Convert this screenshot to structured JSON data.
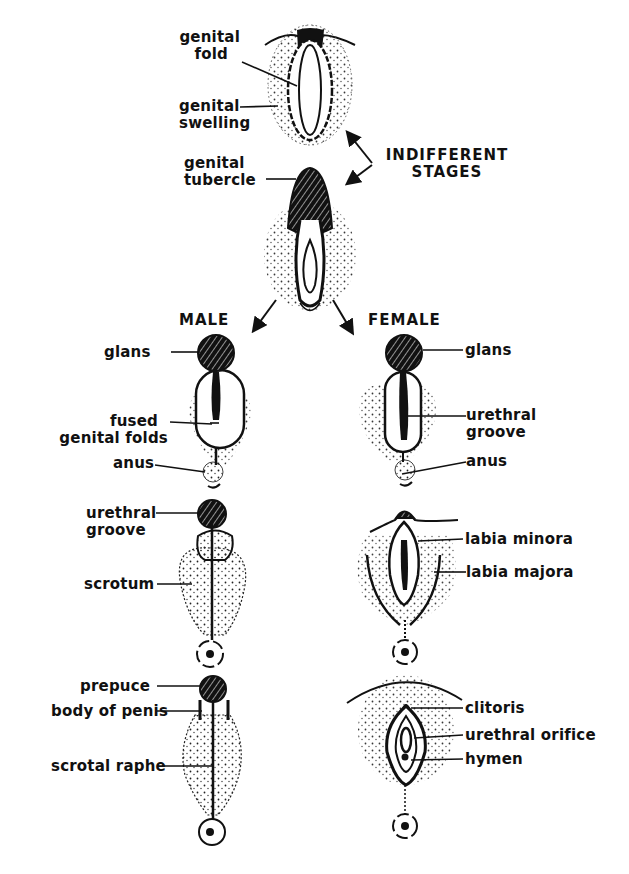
{
  "diagram": {
    "section_labels": {
      "indifferent": "INDIFFERENT",
      "stages": "STAGES",
      "male": "MALE",
      "female": "FEMALE"
    },
    "indifferent_stage_1": {
      "genital_fold": [
        "genital",
        "fold"
      ],
      "genital_swelling": [
        "genital",
        "swelling"
      ]
    },
    "indifferent_stage_2": {
      "genital_tubercle": [
        "genital",
        "tubercle"
      ]
    },
    "male_stage_1": {
      "glans": "glans",
      "fused_genital_folds": [
        "fused",
        "genital folds"
      ],
      "anus": "anus"
    },
    "male_stage_2": {
      "urethral_groove": [
        "urethral",
        "groove"
      ],
      "scrotum": "scrotum"
    },
    "male_stage_3": {
      "prepuce": "prepuce",
      "body_of_penis": "body of penis",
      "scrotal_raphe": "scrotal raphe"
    },
    "female_stage_1": {
      "glans": "glans",
      "urethral_groove": [
        "urethral",
        "groove"
      ],
      "anus": "anus"
    },
    "female_stage_2": {
      "labia_minora": "labia minora",
      "labia_majora": "labia majora"
    },
    "female_stage_3": {
      "clitoris": "clitoris",
      "urethral_orifice": "urethral orifice",
      "hymen": "hymen"
    },
    "colors": {
      "ink": "#111111",
      "background": "#ffffff"
    }
  }
}
